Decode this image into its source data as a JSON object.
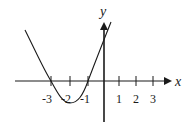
{
  "diagram": {
    "type": "function-graph",
    "axes": {
      "x_label": "x",
      "y_label": "y"
    },
    "x_ticks": [
      {
        "value": -3,
        "label": "-3"
      },
      {
        "value": -2,
        "label": "-2"
      },
      {
        "value": -1,
        "label": "-1"
      },
      {
        "value": 1,
        "label": "1"
      },
      {
        "value": 2,
        "label": "2"
      },
      {
        "value": 3,
        "label": "3"
      }
    ],
    "curve": {
      "kind": "parabola",
      "opens": "up",
      "x_intercepts": [
        -3,
        -1
      ],
      "vertex_x": -2,
      "color": "#1a1a1a"
    }
  }
}
